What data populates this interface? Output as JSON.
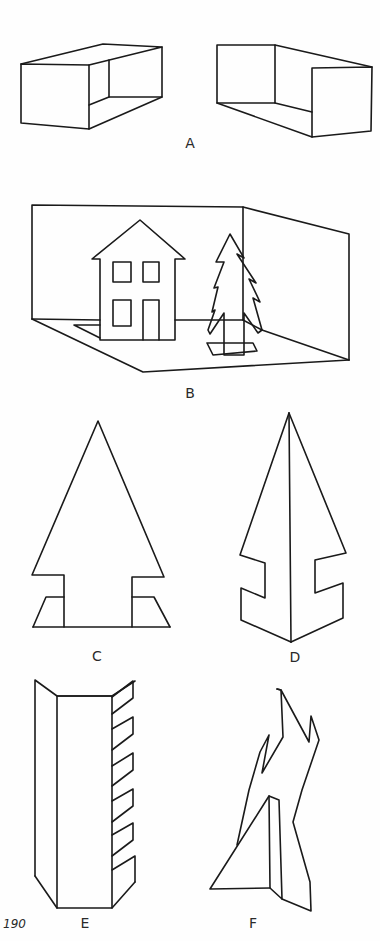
{
  "page": {
    "page_number": "190",
    "background": "#fefefe",
    "ink_color": "#1a1a1a"
  },
  "figures": {
    "A": {
      "label": "A",
      "description": "Two open boxes drawn in perspective"
    },
    "B": {
      "label": "B",
      "description": "Diorama box with house and standing tree cutout"
    },
    "C": {
      "label": "C",
      "description": "Flat tree cutout with folded base tabs"
    },
    "D": {
      "label": "D",
      "description": "Tree folded along center line with notched sides"
    },
    "E": {
      "label": "E",
      "description": "Folded column with fringed right flap"
    },
    "F": {
      "label": "F",
      "description": "Freestanding abstract cutout with triangular support"
    }
  }
}
